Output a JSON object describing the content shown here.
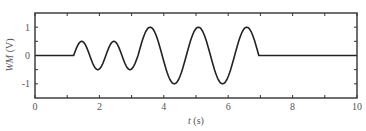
{
  "chart_data": {
    "type": "line",
    "title": "",
    "xlabel": "t (s)",
    "xlabel_var": "t",
    "xlabel_unit": " (s)",
    "ylabel": "WM (V)",
    "ylabel_var": "WM",
    "ylabel_unit": " (V)",
    "xlim": [
      0,
      10
    ],
    "ylim": [
      -1.5,
      1.5
    ],
    "grid": false,
    "legend": null,
    "xticks": [
      0,
      2,
      4,
      6,
      8,
      10
    ],
    "xtick_labels": [
      "0",
      "2",
      "4",
      "6",
      "8",
      "10"
    ],
    "xminor_ticks": [
      1,
      3,
      5,
      7,
      9
    ],
    "yticks": [
      1,
      0,
      -1
    ],
    "ytick_labels": [
      "1",
      "0",
      "-1"
    ],
    "yminor_ticks": [
      0.5,
      -0.5
    ],
    "series": [
      {
        "name": "WM",
        "color": "#222222",
        "segments": [
          {
            "type": "flat",
            "t_start": 0,
            "t_end": 1.2,
            "value": 0
          },
          {
            "type": "sine",
            "t_start": 1.2,
            "t_end": 3.2,
            "amplitude": 0.5,
            "period": 1.0
          },
          {
            "type": "sine",
            "t_start": 3.2,
            "t_end": 6.95,
            "amplitude": 1.0,
            "period": 1.5
          },
          {
            "type": "flat",
            "t_start": 6.95,
            "t_end": 10,
            "value": 0
          }
        ],
        "key_points": [
          {
            "t": 0,
            "v": 0
          },
          {
            "t": 1.2,
            "v": 0
          },
          {
            "t": 1.45,
            "v": 0.5
          },
          {
            "t": 1.95,
            "v": -0.5
          },
          {
            "t": 2.45,
            "v": 0.5
          },
          {
            "t": 2.95,
            "v": -0.5
          },
          {
            "t": 3.55,
            "v": 1.0
          },
          {
            "t": 4.3,
            "v": -1.0
          },
          {
            "t": 5.05,
            "v": 1.0
          },
          {
            "t": 5.8,
            "v": -1.0
          },
          {
            "t": 6.55,
            "v": 1.0
          },
          {
            "t": 6.95,
            "v": 0
          },
          {
            "t": 10,
            "v": 0
          }
        ]
      }
    ]
  },
  "layout": {
    "plot_left": 35,
    "plot_top": 13,
    "plot_right": 357,
    "plot_bottom": 98
  }
}
